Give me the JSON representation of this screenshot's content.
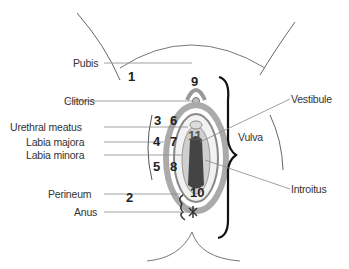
{
  "diagram": {
    "left_labels": [
      {
        "id": "pubis",
        "text": "Pubis"
      },
      {
        "id": "clitoris",
        "text": "Clitoris"
      },
      {
        "id": "urethral-meatus",
        "text": "Urethral meatus"
      },
      {
        "id": "labia-majora",
        "text": "Labia majora"
      },
      {
        "id": "labia-minora",
        "text": "Labia minora"
      },
      {
        "id": "perineum",
        "text": "Perineum"
      },
      {
        "id": "anus",
        "text": "Anus"
      }
    ],
    "right_labels": [
      {
        "id": "vestibule",
        "text": "Vestibule"
      },
      {
        "id": "vulva",
        "text": "Vulva"
      },
      {
        "id": "introitus",
        "text": "Introitus"
      }
    ],
    "numbers": [
      "1",
      "2",
      "3",
      "4",
      "5",
      "6",
      "7",
      "8",
      "9",
      "10",
      "11"
    ]
  }
}
